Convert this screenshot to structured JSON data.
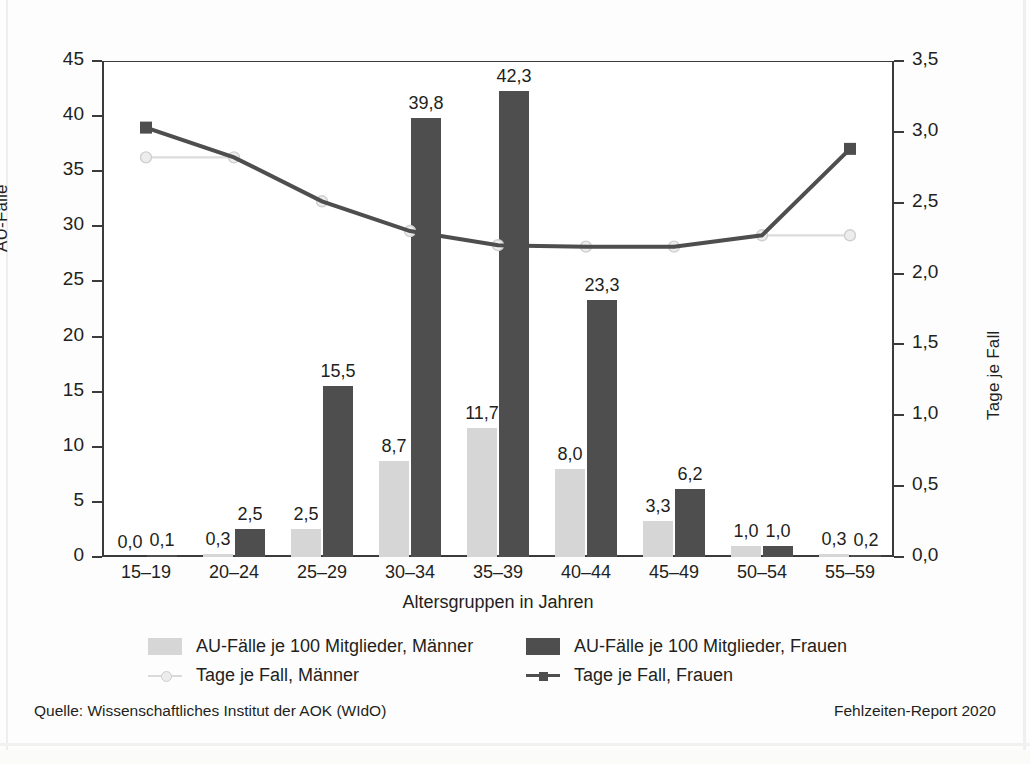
{
  "chart_data": {
    "type": "bar",
    "title": "",
    "subtitle": "",
    "xlabel": "Altersgruppen in Jahren",
    "ylabel": "AU-Fälle",
    "ylabel_right": "Tage je Fall",
    "categories": [
      "15–19",
      "20–24",
      "25–29",
      "30–34",
      "35–39",
      "40–44",
      "45–49",
      "50–54",
      "55–59"
    ],
    "ylim": [
      0,
      45
    ],
    "yticks": [
      "0",
      "5",
      "10",
      "15",
      "20",
      "25",
      "30",
      "35",
      "40",
      "45"
    ],
    "ylim_right": [
      0,
      3.5
    ],
    "yticks_right": [
      "0,0",
      "0,5",
      "1,0",
      "1,5",
      "2,0",
      "2,5",
      "3,0",
      "3,5"
    ],
    "grid": false,
    "legend_position": "below",
    "series": [
      {
        "name": "AU-Fälle je 100 Mitglieder, Männer",
        "type": "bar",
        "axis": "left",
        "color": "#d6d6d6",
        "values": [
          0.0,
          0.3,
          2.5,
          8.7,
          11.7,
          8.0,
          3.3,
          1.0,
          0.3
        ],
        "labels": [
          "0,0",
          "0,3",
          "2,5",
          "8,7",
          "11,7",
          "8,0",
          "3,3",
          "1,0",
          "0,3"
        ]
      },
      {
        "name": "AU-Fälle je 100 Mitglieder, Frauen",
        "type": "bar",
        "axis": "left",
        "color": "#4e4e4e",
        "values": [
          0.1,
          2.5,
          15.5,
          39.8,
          42.3,
          23.3,
          6.2,
          1.0,
          0.2
        ],
        "labels": [
          "0,1",
          "2,5",
          "15,5",
          "39,8",
          "42,3",
          "23,3",
          "6,2",
          "1,0",
          "0,2"
        ]
      },
      {
        "name": "Tage je Fall, Männer",
        "type": "line",
        "axis": "right",
        "color": "#dcdcdc",
        "values": [
          2.82,
          2.82,
          2.51,
          2.3,
          2.2,
          2.19,
          2.19,
          2.27,
          2.27
        ]
      },
      {
        "name": "Tage je Fall, Frauen",
        "type": "line",
        "axis": "right",
        "color": "#4e4e4e",
        "values": [
          3.03,
          2.82,
          2.51,
          2.3,
          2.2,
          2.19,
          2.19,
          2.27,
          2.88
        ]
      }
    ]
  },
  "legend": {
    "items": [
      {
        "label": "AU-Fälle je 100 Mitglieder, Männer",
        "marker": "box-light"
      },
      {
        "label": "AU-Fälle je 100 Mitglieder, Frauen",
        "marker": "box-dark"
      },
      {
        "label": "Tage je Fall, Männer",
        "marker": "line-light"
      },
      {
        "label": "Tage je Fall, Frauen",
        "marker": "line-dark"
      }
    ]
  },
  "footer": {
    "source": "Quelle: Wissenschaftliches Institut der AOK (WIdO)",
    "report": "Fehlzeiten-Report 2020"
  }
}
